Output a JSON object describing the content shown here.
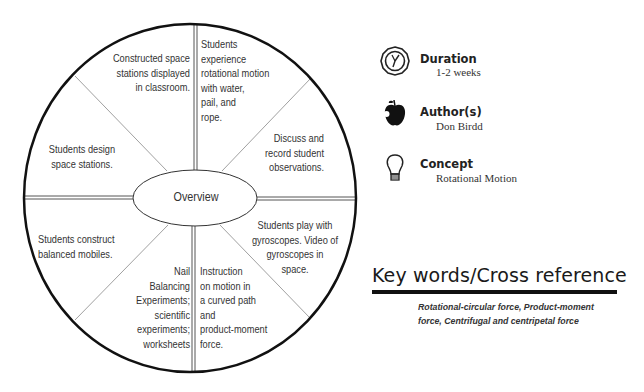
{
  "diagram": {
    "center_label": "Overview",
    "segments": [
      {
        "position": "top-left",
        "text": "Constructed space\nstations displayed\nin classroom."
      },
      {
        "position": "top-right",
        "text": "Students\nexperience\nrotational motion\nwith water,\npail, and\nrope."
      },
      {
        "position": "right-upper",
        "text": "Discuss and\nrecord student\nobservations."
      },
      {
        "position": "right-lower",
        "text": "Students play with\ngyroscopes.  Video of\ngyroscopes in\nspace."
      },
      {
        "position": "bottom-right",
        "text": "Instruction\non motion in\na curved path\nand\nproduct-moment\nforce."
      },
      {
        "position": "bottom-left",
        "text": "Nail\nBalancing\nExperiments;\nscientific\nexperiments;\nworksheets"
      },
      {
        "position": "left-lower",
        "text": "Students construct\nbalanced mobiles."
      },
      {
        "position": "left-upper",
        "text": "Students design\nspace stations."
      }
    ],
    "colors": {
      "outline": "#111111",
      "divider": "#777777",
      "text": "#333333"
    }
  },
  "info": {
    "duration": {
      "label": "Duration",
      "value": "1-2 weeks",
      "icon": "clock-icon"
    },
    "authors": {
      "label": "Author(s)",
      "value": "Don Birdd",
      "icon": "apple-icon"
    },
    "concept": {
      "label": "Concept",
      "value": "Rotational Motion",
      "icon": "lightbulb-icon"
    }
  },
  "keywords": {
    "heading": "Key words/Cross reference",
    "body": "Rotational-circular force, Product-moment\nforce, Centrifugal and centripetal force"
  }
}
